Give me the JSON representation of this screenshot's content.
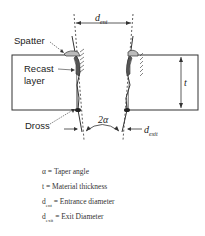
{
  "diagram": {
    "labels": {
      "spatter": "Spatter",
      "recast": "Recast",
      "recast2": "layer",
      "dross": "Dross",
      "d_ent_symbol": "d",
      "d_ent_sub": "ent",
      "d_exit_symbol": "d",
      "d_exit_sub": "exit",
      "t_symbol": "t",
      "angle_symbol": "2α"
    },
    "legend": [
      {
        "symbol": "α",
        "sub": "",
        "text": " = Taper angle"
      },
      {
        "symbol": "t",
        "sub": "",
        "text": " = Material thickness"
      },
      {
        "symbol": "d",
        "sub": "ent",
        "text": " = Entrance diameter"
      },
      {
        "symbol": "d",
        "sub": "exit",
        "text": " = Exit Diameter"
      }
    ],
    "colors": {
      "line": "#333333",
      "background": "#ffffff"
    }
  }
}
